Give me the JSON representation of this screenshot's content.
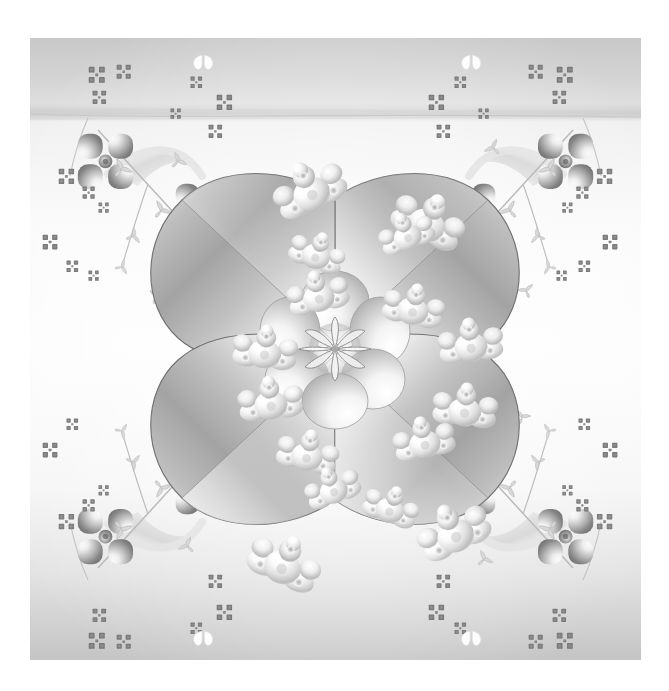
{
  "page": {
    "canvas_width": 669,
    "canvas_height": 691,
    "page_background": "#ffffff",
    "margin_left": 30,
    "margin_top": 38,
    "art_width": 611,
    "art_height": 622
  },
  "artwork": {
    "name": "symmetric-floral-ornament",
    "style": "grayscale airbrush / vector gradient ornament",
    "symmetry": "4-fold mirror (vertical + horizontal axes through center)",
    "center": {
      "x": 305,
      "y": 311
    },
    "description": "Grayscale decorative quatrefoil: four large teardrop petals radiating from a six-petal central rosette, scattered glossy insect motifs, four corner clusters of four-petal gradient flowers linked by ribbons and arrow-leaf stems, and small checkered flower specks across a pale vertical gradient ground."
  },
  "palette": {
    "ground_top": "#c9c9c9",
    "ground_upper_mid": "#dcdcdc",
    "ground_mid": "#f4f4f4",
    "ground_lower_mid": "#ededed",
    "ground_bottom": "#c6c6c6",
    "band_line": "#c3c3c3",
    "petal_dark": "#8d8d8d",
    "petal_mid": "#b9b9b9",
    "petal_light": "#fbfbfb",
    "petal_outline": "#6f6f76",
    "rosette_dark": "#9a9a9a",
    "rosette_light": "#ffffff",
    "corner_flower_dark": "#6e6e6e",
    "corner_flower_light": "#f2f2f2",
    "stem_line": "#b4b4b4",
    "ribbon": "#e2e2e2",
    "speck_dark": "#7b7b7b",
    "bug_highlight": "#ffffff",
    "bug_shade": "#b0b0b0"
  },
  "layers": [
    {
      "name": "background-gradient",
      "z": 0,
      "label": "Background"
    },
    {
      "name": "horizon-band",
      "z": 1,
      "label": "Horizon band"
    },
    {
      "name": "corner-clusters",
      "z": 2,
      "label": "Corner flower clusters"
    },
    {
      "name": "background-specks",
      "z": 3,
      "label": "Checker specks"
    },
    {
      "name": "large-petals",
      "z": 4,
      "label": "Large petals"
    },
    {
      "name": "center-rosette",
      "z": 5,
      "label": "Center rosette"
    },
    {
      "name": "insect-motifs",
      "z": 6,
      "label": "Insect motifs"
    }
  ],
  "chart_data": {
    "type": "scatter",
    "xlabel": "x (art px)",
    "ylabel": "y (art px)",
    "xlim": [
      0,
      611
    ],
    "ylim": [
      0,
      622
    ],
    "grid": false,
    "legend": "none",
    "series": [
      {
        "name": "large-petals",
        "note": "teardrop petals, tip at rosette, bulge outward",
        "points": [
          {
            "angle": 45,
            "cx": 400,
            "cy": 215,
            "label": "petal-top-right"
          },
          {
            "angle": 135,
            "cx": 210,
            "cy": 215,
            "label": "petal-top-left"
          },
          {
            "angle": 225,
            "cx": 210,
            "cy": 407,
            "label": "petal-bottom-left"
          },
          {
            "angle": 315,
            "cx": 400,
            "cy": 407,
            "label": "petal-bottom-right"
          }
        ]
      },
      {
        "name": "center-rosette",
        "petal_count": 6,
        "radius": 62,
        "points": [
          {
            "cx": 305,
            "cy": 311,
            "label": "rosette"
          }
        ]
      },
      {
        "name": "insect-motifs",
        "count": 16,
        "points": [
          {
            "cx": 215,
            "cy": 150
          },
          {
            "cx": 395,
            "cy": 150
          },
          {
            "cx": 243,
            "cy": 183
          },
          {
            "cx": 367,
            "cy": 183
          },
          {
            "cx": 246,
            "cy": 238
          },
          {
            "cx": 364,
            "cy": 238
          },
          {
            "cx": 195,
            "cy": 277
          },
          {
            "cx": 415,
            "cy": 277
          },
          {
            "cx": 195,
            "cy": 345
          },
          {
            "cx": 415,
            "cy": 345
          },
          {
            "cx": 246,
            "cy": 384
          },
          {
            "cx": 364,
            "cy": 384
          },
          {
            "cx": 243,
            "cy": 439
          },
          {
            "cx": 367,
            "cy": 439
          },
          {
            "cx": 215,
            "cy": 472
          },
          {
            "cx": 395,
            "cy": 472
          }
        ]
      },
      {
        "name": "corner-flowers",
        "count": 8,
        "petal_count": 4,
        "points": [
          {
            "cx": 88,
            "cy": 110,
            "r": 28
          },
          {
            "cx": 522,
            "cy": 110,
            "r": 28
          },
          {
            "cx": 137,
            "cy": 160,
            "r": 26
          },
          {
            "cx": 473,
            "cy": 160,
            "r": 26
          },
          {
            "cx": 88,
            "cy": 512,
            "r": 28
          },
          {
            "cx": 522,
            "cy": 512,
            "r": 28
          },
          {
            "cx": 137,
            "cy": 462,
            "r": 26
          },
          {
            "cx": 473,
            "cy": 462,
            "r": 26
          }
        ]
      },
      {
        "name": "checker-specks",
        "count": 34,
        "note": "tiny four-lobed checkered florets scattered along stems and field"
      }
    ]
  }
}
